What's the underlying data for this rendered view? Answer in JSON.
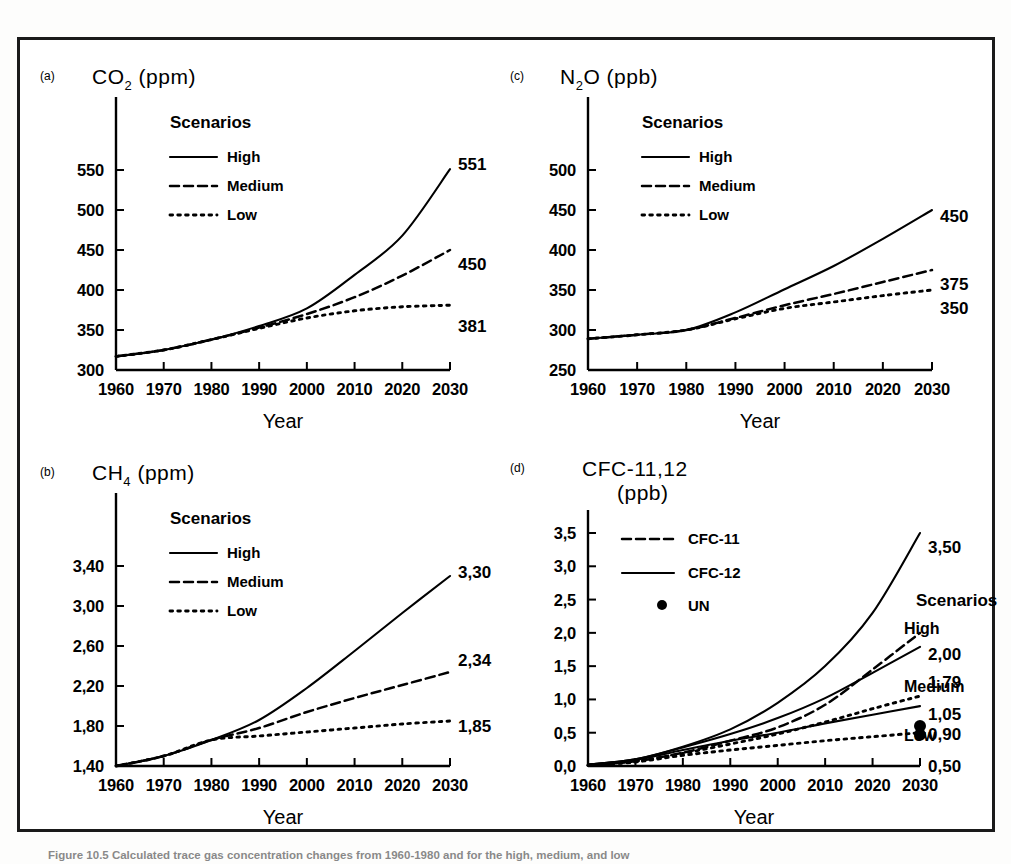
{
  "figure": {
    "caption": "Figure 10.5 Calculated trace gas concentration changes from 1960-1980 and for the high, medium, and low"
  },
  "axis": {
    "x_name": "Year",
    "x_ticks": [
      "1960",
      "1970",
      "1980",
      "1990",
      "2000",
      "2010",
      "2020",
      "2030"
    ],
    "x_min": 1960,
    "x_max": 2030
  },
  "legend": {
    "title": "Scenarios",
    "high": "High",
    "medium": "Medium",
    "low": "Low",
    "cfc11": "CFC-11",
    "cfc12": "CFC-12",
    "un": "UN"
  },
  "panels": {
    "a": {
      "letter": "(a)",
      "title": "CO",
      "title_sub": "2",
      "title_unit": "(ppm)",
      "y_ticks": [
        "300",
        "350",
        "400",
        "450",
        "500",
        "550"
      ],
      "end_labels": [
        "551",
        "450",
        "381"
      ]
    },
    "b": {
      "letter": "(b)",
      "title": "CH",
      "title_sub": "4",
      "title_unit": "(ppm)",
      "y_ticks": [
        "1,40",
        "1,80",
        "2,20",
        "2,60",
        "3,00",
        "3,40"
      ],
      "end_labels": [
        "3,30",
        "2,34",
        "1,85"
      ]
    },
    "c": {
      "letter": "(c)",
      "title": "N",
      "title_sub": "2",
      "title_tail": "O",
      "title_unit": "(ppb)",
      "y_ticks": [
        "250",
        "300",
        "350",
        "400",
        "450",
        "500"
      ],
      "end_labels": [
        "450",
        "375",
        "350"
      ]
    },
    "d": {
      "letter": "(d)",
      "title": "CFC-11,12",
      "title_unit": "(ppb)",
      "y_ticks": [
        "0,0",
        "0,5",
        "1,0",
        "1,5",
        "2,0",
        "2,5",
        "3,0",
        "3,5"
      ],
      "scen_high": "High",
      "scen_medium": "Medium",
      "scen_low": "Low",
      "end_labels": [
        "3,50",
        "2,00",
        "1,79",
        "1,05",
        "0,90",
        "0,50"
      ]
    }
  },
  "chart_data": [
    {
      "type": "line",
      "title": "CO2 (ppm)",
      "panel": "a",
      "xlabel": "Year",
      "ylabel": "CO2 (ppm)",
      "xlim": [
        1960,
        2030
      ],
      "ylim": [
        300,
        550
      ],
      "grid": false,
      "legend_position": "upper-left",
      "x": [
        1960,
        1970,
        1980,
        1990,
        2000,
        2010,
        2020,
        2030
      ],
      "series": [
        {
          "name": "High",
          "style": "solid",
          "values": [
            317,
            325,
            338,
            355,
            377,
            419,
            468,
            551
          ],
          "end_label": "551"
        },
        {
          "name": "Medium",
          "style": "dashed",
          "values": [
            317,
            325,
            338,
            353,
            370,
            391,
            418,
            450
          ],
          "end_label": "450"
        },
        {
          "name": "Low",
          "style": "dotted",
          "values": [
            317,
            325,
            338,
            352,
            365,
            374,
            379,
            381
          ],
          "end_label": "381"
        }
      ]
    },
    {
      "type": "line",
      "title": "CH4 (ppm)",
      "panel": "b",
      "xlabel": "Year",
      "ylabel": "CH4 (ppm)",
      "xlim": [
        1960,
        2030
      ],
      "ylim": [
        1.4,
        3.4
      ],
      "grid": false,
      "legend_position": "upper-left",
      "x": [
        1960,
        1970,
        1980,
        1990,
        2000,
        2010,
        2020,
        2030
      ],
      "series": [
        {
          "name": "High",
          "style": "solid",
          "values": [
            1.4,
            1.5,
            1.66,
            1.86,
            2.18,
            2.55,
            2.93,
            3.3
          ],
          "end_label": "3,30"
        },
        {
          "name": "Medium",
          "style": "dashed",
          "values": [
            1.4,
            1.5,
            1.66,
            1.78,
            1.94,
            2.08,
            2.21,
            2.34
          ],
          "end_label": "2,34"
        },
        {
          "name": "Low",
          "style": "dotted",
          "values": [
            1.4,
            1.5,
            1.66,
            1.7,
            1.74,
            1.78,
            1.82,
            1.85
          ],
          "end_label": "1,85"
        }
      ]
    },
    {
      "type": "line",
      "title": "N2O (ppb)",
      "panel": "c",
      "xlabel": "Year",
      "ylabel": "N2O (ppb)",
      "xlim": [
        1960,
        2030
      ],
      "ylim": [
        250,
        500
      ],
      "grid": false,
      "legend_position": "upper-left",
      "x": [
        1960,
        1970,
        1980,
        1990,
        2000,
        2010,
        2020,
        2030
      ],
      "series": [
        {
          "name": "High",
          "style": "solid",
          "values": [
            289,
            294,
            300,
            322,
            351,
            380,
            414,
            450
          ],
          "end_label": "450"
        },
        {
          "name": "Medium",
          "style": "dashed",
          "values": [
            289,
            294,
            300,
            315,
            331,
            345,
            360,
            375
          ],
          "end_label": "375"
        },
        {
          "name": "Low",
          "style": "dotted",
          "values": [
            289,
            294,
            300,
            314,
            327,
            335,
            343,
            350
          ],
          "end_label": "350"
        }
      ]
    },
    {
      "type": "line",
      "title": "CFC-11,12 (ppb)",
      "panel": "d",
      "xlabel": "Year",
      "ylabel": "CFC-11,12 (ppb)",
      "xlim": [
        1960,
        2030
      ],
      "ylim": [
        0.0,
        3.5
      ],
      "grid": false,
      "legend_position": "upper-left",
      "series": [
        {
          "name": "CFC-12 High",
          "style": "solid",
          "values": [
            0.02,
            0.1,
            0.29,
            0.55,
            0.95,
            1.5,
            2.3,
            3.5
          ],
          "end_label": "3,50"
        },
        {
          "name": "CFC-11 High",
          "style": "dashed",
          "values": [
            0.01,
            0.07,
            0.2,
            0.38,
            0.58,
            0.92,
            1.45,
            2.0
          ],
          "end_label": "2,00"
        },
        {
          "name": "CFC-12 Medium",
          "style": "solid",
          "values": [
            0.02,
            0.1,
            0.28,
            0.48,
            0.72,
            1.02,
            1.4,
            1.79
          ],
          "end_label": "1,79"
        },
        {
          "name": "CFC-11 Medium",
          "style": "dotted",
          "values": [
            0.01,
            0.07,
            0.19,
            0.33,
            0.48,
            0.66,
            0.86,
            1.05
          ],
          "end_label": "1,05"
        },
        {
          "name": "CFC-12 Low",
          "style": "solid",
          "values": [
            0.02,
            0.09,
            0.24,
            0.38,
            0.5,
            0.64,
            0.77,
            0.9
          ],
          "end_label": "0,90"
        },
        {
          "name": "CFC-11 Low",
          "style": "dotted",
          "values": [
            0.01,
            0.06,
            0.16,
            0.24,
            0.31,
            0.38,
            0.44,
            0.5
          ],
          "end_label": "0,50"
        }
      ],
      "x": [
        1960,
        1970,
        1980,
        1990,
        2000,
        2010,
        2020,
        2030
      ],
      "markers": [
        {
          "name": "UN",
          "x": 2030,
          "y": 0.6
        },
        {
          "name": "UN",
          "x": 2030,
          "y": 0.47
        }
      ]
    }
  ]
}
